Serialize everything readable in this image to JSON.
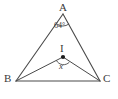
{
  "figure": {
    "type": "geometry-diagram",
    "stroke_color": "#4a4a4a",
    "text_color": "#3a3a3a",
    "background_color": "#ffffff",
    "vertices": [
      {
        "name": "A",
        "label": "A",
        "x": 63,
        "y": 14
      },
      {
        "name": "B",
        "label": "B",
        "x": 16,
        "y": 81
      },
      {
        "name": "C",
        "label": "C",
        "x": 100,
        "y": 81
      },
      {
        "name": "I",
        "label": "I",
        "x": 63,
        "y": 57
      }
    ],
    "segments": [
      {
        "name": "side-AB",
        "from": "A",
        "to": "B"
      },
      {
        "name": "side-AC",
        "from": "A",
        "to": "C"
      },
      {
        "name": "side-BC",
        "from": "B",
        "to": "C"
      },
      {
        "name": "segment-IB",
        "from": "I",
        "to": "B"
      },
      {
        "name": "segment-IC",
        "from": "I",
        "to": "C"
      }
    ],
    "angles": [
      {
        "name": "angle-at-A",
        "vertex": "A",
        "label": "64°",
        "value": 64,
        "unit": "degrees"
      },
      {
        "name": "angle-at-I",
        "vertex": "I",
        "label": "x",
        "value": null,
        "unit": "degrees"
      }
    ],
    "point_marker": {
      "name": "incenter-dot",
      "x": 63,
      "y": 57,
      "radius": 2
    }
  }
}
